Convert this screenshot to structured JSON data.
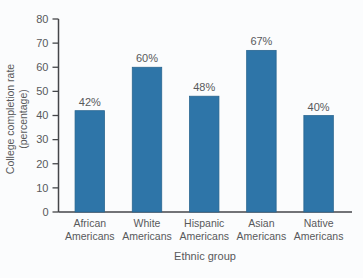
{
  "chart_data": {
    "type": "bar",
    "categories": [
      "African Americans",
      "White Americans",
      "Hispanic Americans",
      "Asian Americans",
      "Native Americans"
    ],
    "values": [
      42,
      60,
      48,
      67,
      40
    ],
    "value_labels": [
      "42%",
      "60%",
      "48%",
      "67%",
      "40%"
    ],
    "title": "",
    "xlabel": "Ethnic group",
    "ylabel": "College completion rate (percentage)",
    "ylabel_lines": [
      "College completion rate",
      "(percentage)"
    ],
    "ylim": [
      0,
      80
    ],
    "ytick_step": 10,
    "ytick_labels": [
      "0",
      "10",
      "20",
      "30",
      "40",
      "50",
      "60",
      "70",
      "80"
    ],
    "legend": "none",
    "grid": false,
    "colors": {
      "bar_fill": "#2e75a8",
      "bar_edge": "#27648f",
      "axis": "#44464a",
      "text": "#58595b",
      "background": "#fbfcfd"
    }
  }
}
